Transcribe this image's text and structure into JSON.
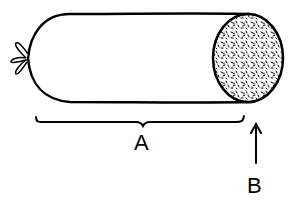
{
  "diagram": {
    "labels": {
      "a": "A",
      "b": "B"
    },
    "colors": {
      "ink": "#000000",
      "background": "#ffffff"
    }
  }
}
